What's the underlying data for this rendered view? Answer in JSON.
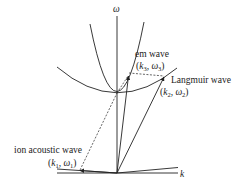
{
  "diagram": {
    "axes": {
      "y_label": "ω",
      "x_label": "k"
    },
    "curves": [
      {
        "name": "em-wave-dispersion",
        "description": "steep parabola"
      },
      {
        "name": "langmuir-wave-dispersion",
        "description": "shallow parabola"
      },
      {
        "name": "ion-acoustic-dispersion",
        "description": "near-linear branch along k axis"
      }
    ],
    "labels": {
      "em_wave": "em wave",
      "em_point": {
        "open": "(",
        "k": "k",
        "k_sub": "3",
        "sep": ", ",
        "w": "ω",
        "w_sub": "3",
        "close": ")"
      },
      "langmuir_wave": "Langmuir wave",
      "langmuir_point": {
        "open": "(",
        "k": "k",
        "k_sub": "2",
        "sep": ", ",
        "w": "ω",
        "w_sub": "2",
        "close": ")"
      },
      "ion_acoustic_wave": "ion acoustic wave",
      "ion_point": {
        "open": "(",
        "k": "k",
        "k_sub": "1",
        "sep": ", ",
        "w": "ω",
        "w_sub": "1",
        "close": ")"
      }
    },
    "colors": {
      "line": "#222222",
      "background": "#ffffff"
    }
  }
}
